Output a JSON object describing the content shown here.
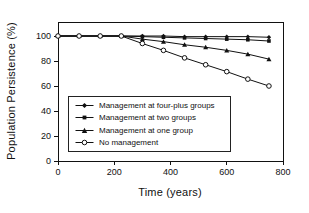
{
  "chart_data": {
    "type": "line",
    "title": "",
    "xlabel": "Time (years)",
    "ylabel": "Population Persistence (%)",
    "xlim": [
      0,
      800
    ],
    "ylim": [
      0,
      111
    ],
    "xticks": [
      0,
      200,
      400,
      600,
      800
    ],
    "yticks": [
      0,
      20,
      40,
      60,
      80,
      100
    ],
    "grid": false,
    "legend_position": "lower-left-inside",
    "line_color": "#111111",
    "background_color": "#ffffff",
    "x": [
      0,
      75,
      150,
      225,
      300,
      375,
      450,
      525,
      600,
      675,
      750
    ],
    "series": [
      {
        "name": "Management at four-plus groups",
        "marker": "diamond-filled",
        "values": [
          100,
          100,
          100,
          100,
          100,
          100,
          99.5,
          99.5,
          99.5,
          99.5,
          99
        ]
      },
      {
        "name": "Management at two groups",
        "marker": "square-filled",
        "values": [
          100,
          100,
          100,
          100,
          99.5,
          99,
          98.5,
          98,
          97.5,
          97,
          96
        ]
      },
      {
        "name": "Management at one group",
        "marker": "triangle-filled",
        "values": [
          100,
          100,
          100,
          100,
          97.5,
          95.5,
          93,
          91,
          88.5,
          85.5,
          81.5
        ]
      },
      {
        "name": "No management",
        "marker": "circle-open",
        "values": [
          100,
          100,
          100,
          100,
          94,
          88.5,
          82.5,
          77,
          71.5,
          65.5,
          60
        ]
      }
    ]
  }
}
